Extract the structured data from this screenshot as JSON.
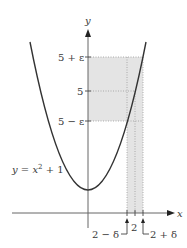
{
  "diagram": {
    "type": "function-limit-epsilon-delta",
    "function_label": "y = x² + 1",
    "function_label_parts": {
      "lhs": "y",
      "eq": " = ",
      "var": "x",
      "exp": "2",
      "rest": " + 1"
    },
    "axes": {
      "x_label": "x",
      "y_label": "y"
    },
    "y_ticks": [
      {
        "label": "5 + ε",
        "value": "5+eps"
      },
      {
        "label": "5",
        "value": 5
      },
      {
        "label": "5 − ε",
        "value": "5-eps"
      }
    ],
    "x_ticks": [
      {
        "label": "2 − δ",
        "value": "2-delta"
      },
      {
        "label": "2",
        "value": 2
      },
      {
        "label": "2 + δ",
        "value": "2+delta"
      }
    ],
    "colors": {
      "curve": "#3a3a3a",
      "axis": "#555555",
      "shade": "#e2e2e2",
      "dotted": "#9a9a9a"
    }
  }
}
